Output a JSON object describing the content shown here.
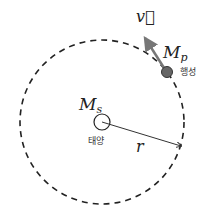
{
  "diagram": {
    "velocity_label": "v⃗",
    "planet_mass_label": "M",
    "planet_mass_sub": "p",
    "planet_name": "행성",
    "sun_mass_label": "M",
    "sun_mass_sub": "s",
    "sun_name": "태양",
    "radius_label": "r"
  },
  "colors": {
    "orbit": "#222222",
    "planet": "#666666",
    "arrow": "#777777",
    "radius": "#333333"
  }
}
